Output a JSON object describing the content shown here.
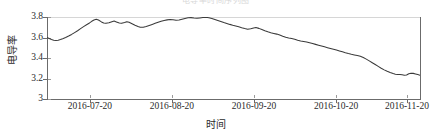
{
  "figure": {
    "clipped_title": "电导率时间序列图",
    "background": "#ffffff",
    "line_color": "#3a3a3a",
    "axis_color": "#6b6b6b",
    "grid_color": "#d6d6d6"
  },
  "chart_data": {
    "type": "line",
    "title": "",
    "xlabel": "时间",
    "ylabel": "电导率",
    "ylim": [
      3.0,
      3.8
    ],
    "yticks": [
      3.0,
      3.2,
      3.4,
      3.6,
      3.8
    ],
    "ytick_labels": [
      "3",
      "3.2",
      "3.4",
      "3.6",
      "3.8"
    ],
    "xtick_labels": [
      "2016-07-20",
      "2016-08-20",
      "2016-09-20",
      "2016-10-20",
      "2016-11-20"
    ],
    "xtick_positions": [
      0.115,
      0.335,
      0.555,
      0.775,
      0.965
    ],
    "grid": false,
    "legend": null,
    "series": [
      {
        "name": "电导率",
        "color": "#3a3a3a",
        "x": [
          0.0,
          0.01,
          0.02,
          0.03,
          0.04,
          0.05,
          0.06,
          0.07,
          0.08,
          0.09,
          0.1,
          0.11,
          0.12,
          0.13,
          0.14,
          0.15,
          0.16,
          0.17,
          0.18,
          0.19,
          0.2,
          0.21,
          0.22,
          0.23,
          0.24,
          0.25,
          0.26,
          0.27,
          0.28,
          0.29,
          0.3,
          0.31,
          0.32,
          0.33,
          0.34,
          0.35,
          0.36,
          0.37,
          0.38,
          0.39,
          0.4,
          0.41,
          0.42,
          0.43,
          0.44,
          0.45,
          0.46,
          0.47,
          0.48,
          0.49,
          0.5,
          0.51,
          0.52,
          0.53,
          0.54,
          0.55,
          0.56,
          0.57,
          0.58,
          0.59,
          0.6,
          0.61,
          0.62,
          0.63,
          0.64,
          0.65,
          0.66,
          0.67,
          0.68,
          0.69,
          0.7,
          0.71,
          0.72,
          0.73,
          0.74,
          0.75,
          0.76,
          0.77,
          0.78,
          0.79,
          0.8,
          0.81,
          0.82,
          0.83,
          0.84,
          0.85,
          0.86,
          0.87,
          0.88,
          0.89,
          0.9,
          0.91,
          0.92,
          0.93,
          0.94,
          0.95,
          0.96,
          0.97,
          0.98,
          0.99,
          1.0
        ],
        "y": [
          3.6,
          3.588,
          3.578,
          3.573,
          3.572,
          3.576,
          3.583,
          3.592,
          3.603,
          3.617,
          3.633,
          3.652,
          3.672,
          3.692,
          3.712,
          3.73,
          3.748,
          3.763,
          3.775,
          3.768,
          3.752,
          3.742,
          3.738,
          3.742,
          3.752,
          3.76,
          3.752,
          3.742,
          3.738,
          3.744,
          3.752,
          3.748,
          3.736,
          3.722,
          3.71,
          3.702,
          3.7,
          3.706,
          3.716,
          3.726,
          3.736,
          3.746,
          3.756,
          3.764,
          3.77,
          3.774,
          3.776,
          3.772,
          3.766,
          3.77,
          3.778,
          3.786,
          3.792,
          3.794,
          3.79,
          3.786,
          3.79,
          3.794,
          3.796,
          3.792,
          3.784,
          3.774,
          3.764,
          3.754,
          3.744,
          3.734,
          3.726,
          3.718,
          3.712,
          3.704,
          3.694,
          3.686,
          3.68,
          3.684,
          3.692,
          3.696,
          3.688,
          3.676,
          3.664,
          3.654,
          3.646,
          3.64,
          3.634,
          3.626,
          3.616,
          3.606,
          3.598,
          3.592,
          3.586,
          3.578,
          3.57,
          3.566,
          3.562,
          3.558,
          3.552,
          3.546,
          3.54,
          3.534,
          3.528,
          3.522,
          3.516
        ]
      }
    ],
    "series_tail": {
      "comment": "second half of the same single series, continued",
      "x": [
        1.0,
        1.01,
        1.02,
        1.03,
        1.04,
        1.05
      ],
      "y": [
        3.516,
        3.51,
        3.504,
        3.498,
        3.492,
        3.486
      ]
    },
    "value_range_observed": {
      "min": 3.06,
      "max": 3.8,
      "start": 3.6,
      "end": 3.07
    }
  },
  "path_points": "0,3.600 0.006,3.590 0.012,3.580 0.018,3.573 0.024,3.571 0.030,3.574 0.036,3.580 0.042,3.588 0.050,3.600 0.058,3.614 0.066,3.630 0.074,3.648 0.082,3.666 0.090,3.686 0.098,3.706 0.106,3.724 0.114,3.742 0.120,3.758 0.126,3.770 0.132,3.778 0.138,3.770 0.146,3.752 0.152,3.742 0.158,3.738 0.166,3.744 0.174,3.754 0.180,3.760 0.186,3.752 0.194,3.742 0.200,3.738 0.208,3.746 0.214,3.754 0.220,3.748 0.228,3.734 0.236,3.720 0.244,3.708 0.250,3.700 0.258,3.700 0.266,3.708 0.274,3.718 0.282,3.728 0.290,3.738 0.298,3.748 0.306,3.758 0.314,3.766 0.322,3.772 0.330,3.776 0.338,3.774 0.346,3.768 0.354,3.770 0.362,3.778 0.370,3.786 0.378,3.792 0.386,3.794 0.394,3.790 0.402,3.787 0.410,3.791 0.418,3.795 0.426,3.797 0.434,3.793 0.442,3.786 0.450,3.776 0.458,3.766 0.466,3.756 0.474,3.746 0.482,3.737 0.490,3.728 0.498,3.720 0.506,3.713 0.514,3.705 0.522,3.696 0.530,3.688 0.538,3.681 0.546,3.685 0.554,3.693 0.560,3.697 0.568,3.689 0.576,3.677 0.584,3.665 0.592,3.655 0.600,3.647 0.608,3.640 0.616,3.633 0.624,3.624 0.632,3.613 0.640,3.603 0.648,3.596 0.656,3.590 0.664,3.583 0.672,3.574 0.680,3.566 0.688,3.561 0.696,3.556 0.704,3.549 0.712,3.541 0.720,3.533 0.728,3.525 0.736,3.517 0.744,3.509 0.752,3.501 0.760,3.493 0.768,3.485 0.776,3.477 0.784,3.469 0.792,3.460 0.800,3.451 0.808,3.443 0.816,3.436 0.824,3.430 0.832,3.424 0.840,3.416 0.848,3.404 0.856,3.389 0.864,3.372 0.872,3.354 0.880,3.336 0.888,3.318 0.896,3.300 0.904,3.284 0.912,3.270 0.920,3.258 0.928,3.248 0.934,3.242 0.940,3.238 0.946,3.240 0.952,3.236 0.958,3.232 0.964,3.234 0.970,3.246 0.976,3.252 0.982,3.250 0.988,3.244 0.994,3.238 1.000,3.232"
}
